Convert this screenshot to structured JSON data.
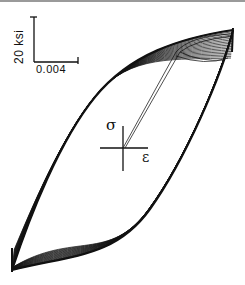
{
  "figure": {
    "scale_bar": {
      "stress_label": "20 ksi",
      "strain_label": "0.004"
    },
    "axes_labels": {
      "stress_symbol": "σ",
      "strain_symbol": "ε"
    },
    "colors": {
      "loop_stroke": "#111111",
      "background": "#ffffff",
      "border": "#9a9a9a"
    }
  },
  "chart_data": {
    "type": "line",
    "title": "",
    "xlabel": "ε",
    "ylabel": "σ",
    "scale_bars": {
      "x": "0.004",
      "y": "20 ksi"
    },
    "grid": false,
    "legend": null,
    "series": [
      {
        "name": "initial loading",
        "points_px": [
          [
            123,
            148
          ],
          [
            178,
            47
          ],
          [
            215,
            38
          ]
        ]
      },
      {
        "name": "loop upper branch (outer)",
        "points_px": [
          [
            12,
            270
          ],
          [
            40,
            190
          ],
          [
            75,
            125
          ],
          [
            95,
            95
          ],
          [
            130,
            62
          ],
          [
            180,
            40
          ],
          [
            233,
            30
          ]
        ]
      },
      {
        "name": "loop lower branch (outer)",
        "points_px": [
          [
            233,
            30
          ],
          [
            215,
            90
          ],
          [
            190,
            140
          ],
          [
            172,
            175
          ],
          [
            150,
            210
          ],
          [
            110,
            240
          ],
          [
            60,
            262
          ],
          [
            12,
            270
          ]
        ]
      }
    ],
    "approx_extremes": {
      "max_stress_strain_px": [
        233,
        30
      ],
      "min_stress_strain_px": [
        12,
        270
      ],
      "origin_px": [
        123,
        148
      ]
    },
    "cycles_overlaid": 18
  }
}
